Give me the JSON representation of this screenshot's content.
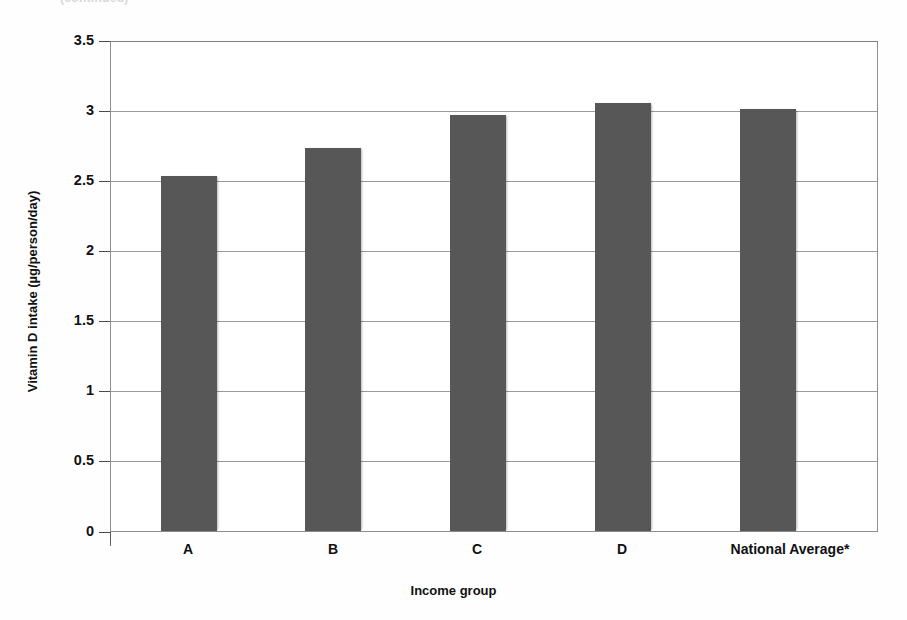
{
  "figure": {
    "top_caption_fragment": "(continued)",
    "background_color": "#ffffff",
    "bar_color": "#575757",
    "grid_color": "#9a9a9a",
    "axis_color": "#6d6d6d",
    "text_color": "#111111"
  },
  "chart_data": {
    "type": "bar",
    "title": "",
    "subtitle": "",
    "xlabel": "Income group",
    "ylabel": "Vitamin D intake (µg/person/day)",
    "categories": [
      "A",
      "B",
      "C",
      "D",
      "National Average*"
    ],
    "values": [
      2.54,
      2.74,
      2.98,
      3.06,
      3.02
    ],
    "series": [
      {
        "name": "Vitamin D intake",
        "values": [
          2.54,
          2.74,
          2.98,
          3.06,
          3.02
        ]
      }
    ],
    "ylim": [
      0,
      3.5
    ],
    "ytick_labels": [
      "0",
      "0.5",
      "1",
      "1.5",
      "2",
      "2.5",
      "3",
      "3.5"
    ],
    "ytick_values": [
      0,
      0.5,
      1,
      1.5,
      2,
      2.5,
      3,
      3.5
    ],
    "grid": true,
    "grid_axis": "y",
    "legend": false,
    "legend_position": "none",
    "annotations": [
      "*"
    ],
    "bar_color": "#575757"
  }
}
